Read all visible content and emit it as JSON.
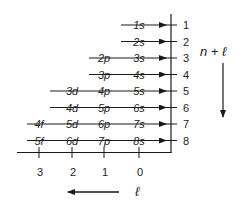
{
  "diagram": {
    "type": "madelung-rule-orbital-filling-order",
    "right_axis": {
      "label": "n + ℓ",
      "ticks": [
        "1",
        "2",
        "3",
        "4",
        "5",
        "6",
        "7",
        "8"
      ],
      "direction": "down"
    },
    "bottom_axis": {
      "label": "ℓ",
      "ticks": [
        "3",
        "2",
        "1",
        "0"
      ],
      "direction": "left"
    },
    "rows": [
      {
        "n_plus_l": "1",
        "orbitals": [
          "1s"
        ]
      },
      {
        "n_plus_l": "2",
        "orbitals": [
          "2s"
        ]
      },
      {
        "n_plus_l": "3",
        "orbitals": [
          "2p",
          "3s"
        ]
      },
      {
        "n_plus_l": "4",
        "orbitals": [
          "3p",
          "4s"
        ]
      },
      {
        "n_plus_l": "5",
        "orbitals": [
          "3d",
          "4p",
          "5s"
        ]
      },
      {
        "n_plus_l": "6",
        "orbitals": [
          "4d",
          "5p",
          "6s"
        ]
      },
      {
        "n_plus_l": "7",
        "orbitals": [
          "4f",
          "5d",
          "6p",
          "7s"
        ]
      },
      {
        "n_plus_l": "8",
        "orbitals": [
          "5f",
          "6d",
          "7p",
          "8s"
        ]
      }
    ],
    "colors": {
      "line": "#1a1a1a",
      "text": "#222222",
      "background": "#ffffff"
    }
  }
}
